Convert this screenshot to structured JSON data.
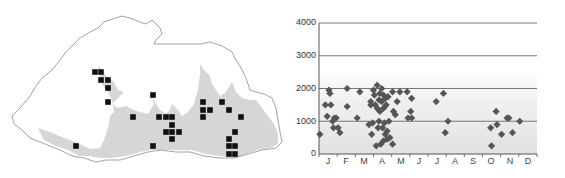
{
  "map": {
    "description": "Distribution map with black square occurrence records over outline with shaded southern lowland region",
    "outline_color": "#888888",
    "shaded_region_color": "#d4d4d4",
    "marker_color": "#111111",
    "markers": [
      [
        95,
        72
      ],
      [
        101,
        72
      ],
      [
        101,
        80
      ],
      [
        108,
        80
      ],
      [
        108,
        88
      ],
      [
        108,
        102
      ],
      [
        133,
        117
      ],
      [
        153,
        95
      ],
      [
        159,
        117
      ],
      [
        166,
        117
      ],
      [
        172,
        117
      ],
      [
        172,
        125
      ],
      [
        166,
        132
      ],
      [
        172,
        132
      ],
      [
        179,
        132
      ],
      [
        172,
        139
      ],
      [
        153,
        146
      ],
      [
        76,
        146
      ],
      [
        203,
        102
      ],
      [
        203,
        110
      ],
      [
        210,
        110
      ],
      [
        203,
        117
      ],
      [
        222,
        102
      ],
      [
        229,
        110
      ],
      [
        241,
        117
      ],
      [
        235,
        132
      ],
      [
        229,
        139
      ],
      [
        229,
        146
      ],
      [
        235,
        146
      ],
      [
        229,
        154
      ],
      [
        235,
        154
      ]
    ]
  },
  "chart_data": {
    "type": "scatter",
    "title": "",
    "xlabel": "",
    "ylabel": "",
    "ylim": [
      0,
      4000
    ],
    "yticks": [
      0,
      1000,
      2000,
      3000,
      4000
    ],
    "categories": [
      "J",
      "F",
      "M",
      "A",
      "M",
      "J",
      "J",
      "A",
      "S",
      "O",
      "N",
      "D"
    ],
    "grid": true,
    "marker": "diamond",
    "marker_color": "#555555",
    "points": [
      {
        "month": 0.05,
        "elev": 600
      },
      {
        "month": 0.35,
        "elev": 1500
      },
      {
        "month": 0.45,
        "elev": 1150
      },
      {
        "month": 0.55,
        "elev": 1950
      },
      {
        "month": 0.6,
        "elev": 1850
      },
      {
        "month": 0.65,
        "elev": 1500
      },
      {
        "month": 0.75,
        "elev": 1000
      },
      {
        "month": 0.8,
        "elev": 800
      },
      {
        "month": 0.85,
        "elev": 1100
      },
      {
        "month": 0.95,
        "elev": 1100
      },
      {
        "month": 1.05,
        "elev": 800
      },
      {
        "month": 1.15,
        "elev": 650
      },
      {
        "month": 1.55,
        "elev": 2000
      },
      {
        "month": 1.55,
        "elev": 1450
      },
      {
        "month": 2.1,
        "elev": 1100
      },
      {
        "month": 2.25,
        "elev": 1900
      },
      {
        "month": 2.75,
        "elev": 900
      },
      {
        "month": 2.85,
        "elev": 1600
      },
      {
        "month": 2.85,
        "elev": 1500
      },
      {
        "month": 2.9,
        "elev": 600
      },
      {
        "month": 2.95,
        "elev": 950
      },
      {
        "month": 3.0,
        "elev": 1950
      },
      {
        "month": 3.05,
        "elev": 1800
      },
      {
        "month": 3.1,
        "elev": 1500
      },
      {
        "month": 3.15,
        "elev": 250
      },
      {
        "month": 3.2,
        "elev": 2100
      },
      {
        "month": 3.2,
        "elev": 1400
      },
      {
        "month": 3.25,
        "elev": 800
      },
      {
        "month": 3.3,
        "elev": 1650
      },
      {
        "month": 3.3,
        "elev": 1000
      },
      {
        "month": 3.35,
        "elev": 1850
      },
      {
        "month": 3.35,
        "elev": 1300
      },
      {
        "month": 3.4,
        "elev": 300
      },
      {
        "month": 3.45,
        "elev": 2000
      },
      {
        "month": 3.45,
        "elev": 1600
      },
      {
        "month": 3.5,
        "elev": 800
      },
      {
        "month": 3.55,
        "elev": 1800
      },
      {
        "month": 3.55,
        "elev": 1400
      },
      {
        "month": 3.55,
        "elev": 400
      },
      {
        "month": 3.6,
        "elev": 950
      },
      {
        "month": 3.65,
        "elev": 1700
      },
      {
        "month": 3.65,
        "elev": 600
      },
      {
        "month": 3.7,
        "elev": 1500
      },
      {
        "month": 3.75,
        "elev": 700
      },
      {
        "month": 3.75,
        "elev": 450
      },
      {
        "month": 3.8,
        "elev": 1750
      },
      {
        "month": 3.85,
        "elev": 1000
      },
      {
        "month": 3.9,
        "elev": 500
      },
      {
        "month": 4.1,
        "elev": 1300
      },
      {
        "month": 4.2,
        "elev": 1200
      },
      {
        "month": 4.05,
        "elev": 300
      },
      {
        "month": 4.05,
        "elev": 1900
      },
      {
        "month": 4.3,
        "elev": 1600
      },
      {
        "month": 4.45,
        "elev": 1900
      },
      {
        "month": 4.85,
        "elev": 1900
      },
      {
        "month": 4.9,
        "elev": 1100
      },
      {
        "month": 5.05,
        "elev": 1300
      },
      {
        "month": 5.1,
        "elev": 1700
      },
      {
        "month": 5.1,
        "elev": 1100
      },
      {
        "month": 6.45,
        "elev": 1600
      },
      {
        "month": 6.85,
        "elev": 1850
      },
      {
        "month": 6.95,
        "elev": 650
      },
      {
        "month": 7.1,
        "elev": 1000
      },
      {
        "month": 9.45,
        "elev": 800
      },
      {
        "month": 9.5,
        "elev": 250
      },
      {
        "month": 9.75,
        "elev": 1300
      },
      {
        "month": 9.8,
        "elev": 900
      },
      {
        "month": 10.05,
        "elev": 600
      },
      {
        "month": 10.35,
        "elev": 1100
      },
      {
        "month": 10.45,
        "elev": 1100
      },
      {
        "month": 10.65,
        "elev": 650
      },
      {
        "month": 11.05,
        "elev": 1000
      }
    ]
  },
  "axis": {
    "y_labels": [
      "4000",
      "3000",
      "2000",
      "1000",
      "0"
    ],
    "x_labels": [
      "J",
      "F",
      "M",
      "A",
      "M",
      "J",
      "J",
      "A",
      "S",
      "O",
      "N",
      "D"
    ]
  }
}
